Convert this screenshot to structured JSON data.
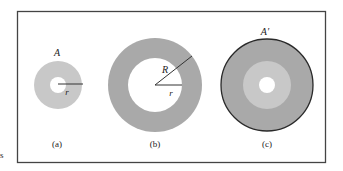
{
  "figure": {
    "frame": {
      "x": 17,
      "y": 11,
      "width": 309,
      "height": 152,
      "stroke": "#444444"
    },
    "stray_mark": "s",
    "colors": {
      "light_ring": "#c8c8c8",
      "dark_ring": "#a9a9a9",
      "hole": "#ffffff",
      "outline": "#2a2a2a",
      "radius_line": "#333333"
    },
    "panels": [
      {
        "id": "a",
        "caption": "(a)",
        "area_label": "A",
        "radius_labels": [
          "r"
        ],
        "center": [
          58,
          85
        ],
        "outer_radius": 24,
        "inner_radius": 8
      },
      {
        "id": "b",
        "caption": "(b)",
        "radius_labels": [
          "R",
          "r"
        ],
        "center": [
          155,
          85
        ],
        "outer_radius": 47,
        "inner_radius": 27
      },
      {
        "id": "c",
        "caption": "(c)",
        "area_label": "A′",
        "center": [
          267,
          85
        ],
        "outer_radius": 46,
        "middle_radius": 24,
        "inner_radius": 8
      }
    ]
  }
}
